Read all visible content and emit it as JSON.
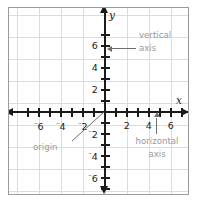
{
  "chart_data": {
    "type": "scatter",
    "title": "",
    "subtitle": "",
    "xlabel": "x",
    "ylabel": "y",
    "xlim": [
      -7.5,
      7.5
    ],
    "ylim": [
      -7.5,
      7.5
    ],
    "grid": true,
    "grid_step": 2,
    "tick_step": 1,
    "legend": "none",
    "series": [],
    "x_tick_labels": [
      {
        "value": -6,
        "text": "6",
        "sign": "⁻"
      },
      {
        "value": -4,
        "text": "4",
        "sign": "⁻"
      },
      {
        "value": -2,
        "text": "2",
        "sign": "⁻"
      },
      {
        "value": 2,
        "text": "2",
        "sign": ""
      },
      {
        "value": 4,
        "text": "4",
        "sign": ""
      },
      {
        "value": 6,
        "text": "6",
        "sign": ""
      }
    ],
    "y_tick_labels": [
      {
        "value": 6,
        "text": "6",
        "sign": ""
      },
      {
        "value": 4,
        "text": "4",
        "sign": ""
      },
      {
        "value": 2,
        "text": "2",
        "sign": ""
      },
      {
        "value": -2,
        "text": "2",
        "sign": "⁻"
      },
      {
        "value": -4,
        "text": "4",
        "sign": "⁻"
      },
      {
        "value": -6,
        "text": "6",
        "sign": "⁻"
      }
    ],
    "annotations": [
      {
        "id": "vertical-axis",
        "line1": "vertical",
        "line2": "axis",
        "points_to": "y-axis",
        "target_value": 5,
        "leader": "arrow-left"
      },
      {
        "id": "horizontal-axis",
        "line1": "horizontal",
        "line2": "axis",
        "points_to": "x-axis",
        "target_value": 4.7,
        "leader": "arrow-up"
      },
      {
        "id": "origin",
        "line1": "origin",
        "line2": "",
        "points_to": "origin",
        "target_value": 0,
        "leader": "diagonal"
      }
    ],
    "colors": {
      "axis": "#1b1b1b",
      "grid": "#dcdcdc",
      "frame": "#9a9a9a",
      "annotation_text": "#9a9a9a",
      "leader": "#6f6f6f",
      "background": "#ffffff"
    }
  },
  "axis_letters": {
    "x": "x",
    "y": "y"
  },
  "annotations": {
    "vertical_axis_line1": "vertical",
    "vertical_axis_line2": "axis",
    "horizontal_axis_line1": "horizontal",
    "horizontal_axis_line2": "axis",
    "origin": "origin"
  }
}
